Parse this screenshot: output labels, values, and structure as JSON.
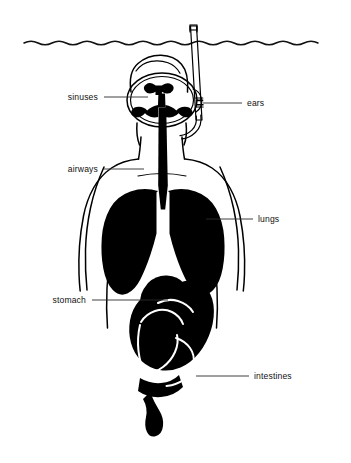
{
  "figure": {
    "background_color": "#ffffff",
    "ink_color": "#000000",
    "leader_color": "#2b2b2b",
    "width": 351,
    "height": 463
  },
  "scene": {
    "waterline_name": "water-surface-line",
    "snorkel_name": "snorkel-tube",
    "mask_name": "diving-mask",
    "body_name": "body-outline"
  },
  "labels": [
    {
      "id": "sinuses",
      "text": "sinuses",
      "side": "left",
      "text_x": 98,
      "text_y": 100,
      "line_x1": 104,
      "line_y1": 97,
      "line_x2": 148,
      "line_y2": 97
    },
    {
      "id": "ears",
      "text": "ears",
      "side": "right",
      "text_x": 247,
      "text_y": 106,
      "line_x1": 242,
      "line_y1": 103,
      "line_x2": 203,
      "line_y2": 103
    },
    {
      "id": "airways",
      "text": "airways",
      "side": "left",
      "text_x": 98,
      "text_y": 172,
      "line_x1": 104,
      "line_y1": 169,
      "line_x2": 144,
      "line_y2": 169
    },
    {
      "id": "lungs",
      "text": "lungs",
      "side": "right",
      "text_x": 258,
      "text_y": 222,
      "line_x1": 253,
      "line_y1": 219,
      "line_x2": 206,
      "line_y2": 219
    },
    {
      "id": "stomach",
      "text": "stomach",
      "side": "left",
      "text_x": 86,
      "text_y": 303,
      "line_x1": 92,
      "line_y1": 300,
      "line_x2": 168,
      "line_y2": 300
    },
    {
      "id": "intestines",
      "text": "intestines",
      "side": "right",
      "text_x": 254,
      "text_y": 379,
      "line_x1": 249,
      "line_y1": 376,
      "line_x2": 196,
      "line_y2": 376
    }
  ],
  "organs": [
    {
      "id": "sinuses-mass",
      "name": "sinus-cavities"
    },
    {
      "id": "trachea",
      "name": "airway-trachea"
    },
    {
      "id": "lung-left",
      "name": "lung-left"
    },
    {
      "id": "lung-right",
      "name": "lung-right"
    },
    {
      "id": "stomach-mass",
      "name": "stomach"
    },
    {
      "id": "intestine-mass",
      "name": "intestines"
    }
  ]
}
